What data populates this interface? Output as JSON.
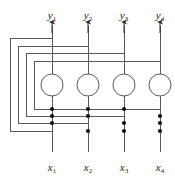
{
  "figure": {
    "type": "recurrent-neural-network-diagram",
    "background_color": "#ffffff",
    "line_color": "#595959",
    "node_stroke_color": "#595959",
    "node_fill_color": "#ffffff",
    "dot_color": "#111111",
    "label_color": "#1a1a1a"
  },
  "outputs": {
    "label_row_y": 10,
    "items": [
      {
        "name": "y1",
        "base": "y",
        "sub": "1",
        "x": 52
      },
      {
        "name": "y2",
        "base": "y",
        "sub": "2",
        "x": 88
      },
      {
        "name": "y3",
        "base": "y",
        "sub": "3",
        "x": 124
      },
      {
        "name": "y4",
        "base": "y",
        "sub": "4",
        "x": 160
      }
    ]
  },
  "inputs": {
    "label_row_y": 162,
    "items": [
      {
        "name": "x1",
        "base": "x",
        "sub": "1",
        "x": 52
      },
      {
        "name": "x2",
        "base": "x",
        "sub": "2",
        "x": 88
      },
      {
        "name": "x3",
        "base": "x",
        "sub": "3",
        "x": 124
      },
      {
        "name": "x4",
        "base": "x",
        "sub": "4",
        "x": 160
      }
    ]
  },
  "neurons": {
    "radius": 11,
    "center_y": 85,
    "items": [
      {
        "name": "neuron-1",
        "cx": 52,
        "cy": 85
      },
      {
        "name": "neuron-2",
        "cx": 88,
        "cy": 85
      },
      {
        "name": "neuron-3",
        "cx": 124,
        "cy": 85
      },
      {
        "name": "neuron-4",
        "cx": 160,
        "cy": 85
      }
    ]
  },
  "columns": {
    "x_positions": [
      52,
      88,
      124,
      160
    ],
    "line_top_y": 22,
    "line_bottom_y": 152,
    "arrow_tip_y": 22
  },
  "feedback_loops": [
    {
      "name": "loop-1",
      "source_column": 1,
      "left_x": 10,
      "top_y": 38,
      "bottom_y": 131,
      "right_x": 52,
      "tap_columns": [
        88,
        124,
        160
      ]
    },
    {
      "name": "loop-2",
      "source_column": 2,
      "left_x": 18,
      "top_y": 46,
      "bottom_y": 123,
      "right_x": 88,
      "tap_columns": [
        52,
        124,
        160
      ]
    },
    {
      "name": "loop-3",
      "source_column": 3,
      "left_x": 26,
      "top_y": 53,
      "bottom_y": 116,
      "right_x": 124,
      "tap_columns": [
        52,
        88,
        160
      ]
    },
    {
      "name": "loop-4",
      "source_column": 4,
      "left_x": 34,
      "top_y": 61,
      "bottom_y": 109,
      "right_x": 160,
      "tap_columns": [
        52,
        88,
        124
      ]
    }
  ],
  "connection_dots": [
    {
      "x": 88,
      "y": 131
    },
    {
      "x": 124,
      "y": 131
    },
    {
      "x": 160,
      "y": 131
    },
    {
      "x": 52,
      "y": 123
    },
    {
      "x": 124,
      "y": 123
    },
    {
      "x": 160,
      "y": 123
    },
    {
      "x": 52,
      "y": 116
    },
    {
      "x": 88,
      "y": 116
    },
    {
      "x": 160,
      "y": 116
    },
    {
      "x": 52,
      "y": 109
    },
    {
      "x": 88,
      "y": 109
    },
    {
      "x": 124,
      "y": 109
    }
  ],
  "chart_data": {
    "type": "diagram",
    "title": "",
    "nodes": 4,
    "inputs": [
      "x1",
      "x2",
      "x3",
      "x4"
    ],
    "outputs": [
      "y1",
      "y2",
      "y3",
      "y4"
    ],
    "edges": [
      {
        "from": "y1",
        "to": [
          "neuron-2",
          "neuron-3",
          "neuron-4"
        ]
      },
      {
        "from": "y2",
        "to": [
          "neuron-1",
          "neuron-3",
          "neuron-4"
        ]
      },
      {
        "from": "y3",
        "to": [
          "neuron-1",
          "neuron-2",
          "neuron-4"
        ]
      },
      {
        "from": "y4",
        "to": [
          "neuron-1",
          "neuron-2",
          "neuron-3"
        ]
      }
    ]
  }
}
